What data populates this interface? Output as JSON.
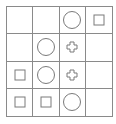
{
  "grid": {
    "rows": 4,
    "cols": 4,
    "line_color": "#8a8a8a",
    "shape_color": "#7a7a7a",
    "cells": [
      [
        "empty",
        "empty",
        "circle",
        "square"
      ],
      [
        "empty",
        "circle",
        "plus",
        "empty"
      ],
      [
        "square",
        "circle",
        "plus",
        "empty"
      ],
      [
        "square",
        "square",
        "circle",
        "empty"
      ]
    ]
  }
}
